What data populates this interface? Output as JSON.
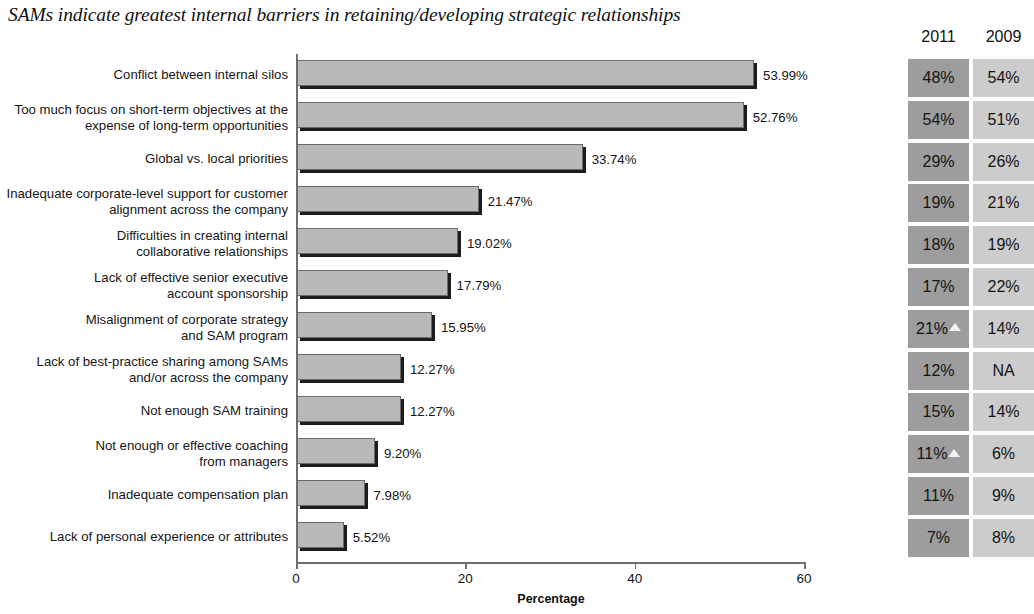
{
  "chart_data": {
    "type": "bar",
    "orientation": "horizontal",
    "title": "SAMs indicate greatest internal barriers in retaining/developing strategic relationships",
    "xlabel": "Percentage",
    "ylabel": "",
    "xlim": [
      0,
      60
    ],
    "xticks": [
      0,
      20,
      40,
      60
    ],
    "grid": false,
    "legend": null,
    "categories": [
      "Conflict between internal silos",
      "Too much focus on short-term objectives at the\nexpense of long-term opportunities",
      "Global vs. local priorities",
      "Inadequate corporate-level support for customer\nalignment across the company",
      "Difficulties in creating internal\ncollaborative relationships",
      "Lack of effective senior executive\naccount sponsorship",
      "Misalignment of corporate strategy\nand SAM program",
      "Lack of best-practice sharing among SAMs\nand/or across the company",
      "Not enough SAM training",
      "Not enough or effective coaching\nfrom managers",
      "Inadequate compensation plan",
      "Lack of personal experience or attributes"
    ],
    "values": [
      53.99,
      52.76,
      33.74,
      21.47,
      19.02,
      17.79,
      15.95,
      12.27,
      12.27,
      9.2,
      7.98,
      5.52
    ],
    "value_labels": [
      "53.99%",
      "52.76%",
      "33.74%",
      "21.47%",
      "19.02%",
      "17.79%",
      "15.95%",
      "12.27%",
      "12.27%",
      "9.20%",
      "7.98%",
      "5.52%"
    ],
    "bar_color": "#b9b9b9",
    "bar_edge_color": "#6a6a6a",
    "bar_shadow_color": "#1c1c1c"
  },
  "side_table": {
    "headers": [
      "2011",
      "2009"
    ],
    "column_colors": [
      "#9d9d9d",
      "#cccccc"
    ],
    "rows": [
      {
        "y2011": "48%",
        "y2009": "54%",
        "marker": false
      },
      {
        "y2011": "54%",
        "y2009": "51%",
        "marker": false
      },
      {
        "y2011": "29%",
        "y2009": "26%",
        "marker": false
      },
      {
        "y2011": "19%",
        "y2009": "21%",
        "marker": false
      },
      {
        "y2011": "18%",
        "y2009": "19%",
        "marker": false
      },
      {
        "y2011": "17%",
        "y2009": "22%",
        "marker": false
      },
      {
        "y2011": "21%",
        "y2009": "14%",
        "marker": true
      },
      {
        "y2011": "12%",
        "y2009": "NA",
        "marker": false
      },
      {
        "y2011": "15%",
        "y2009": "14%",
        "marker": false
      },
      {
        "y2011": "11%",
        "y2009": "6%",
        "marker": true
      },
      {
        "y2011": "11%",
        "y2009": "9%",
        "marker": false
      },
      {
        "y2011": "7%",
        "y2009": "8%",
        "marker": false
      }
    ]
  }
}
